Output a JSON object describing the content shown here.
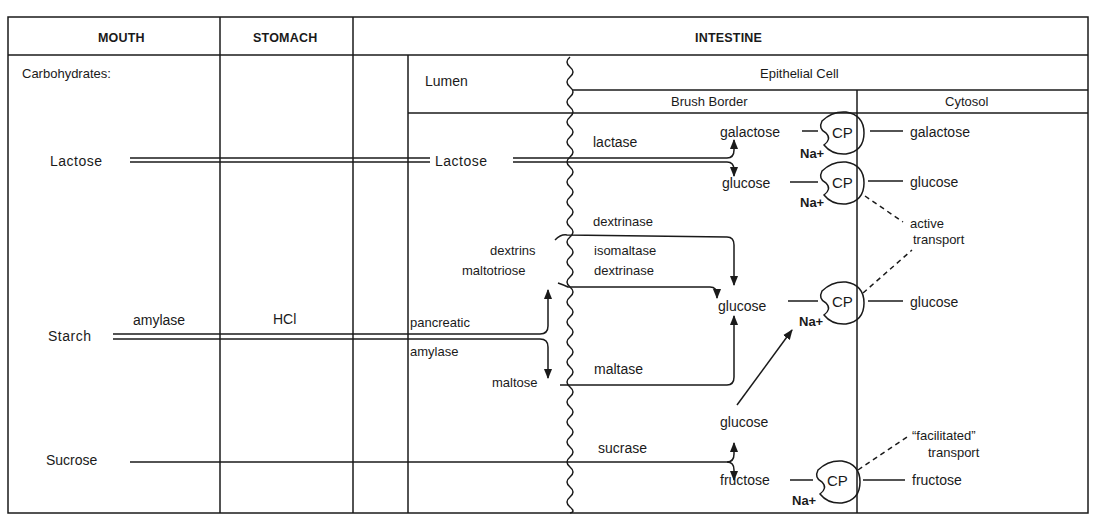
{
  "header": {
    "mouth": "MOUTH",
    "stomach": "STOMACH",
    "intestine": "INTESTINE"
  },
  "subheader": {
    "carbohydrates": "Carbohydrates:",
    "lumen": "Lumen",
    "epithelial_cell": "Epithelial Cell",
    "brush_border": "Brush Border",
    "cytosol": "Cytosol"
  },
  "mouth": {
    "lactose": "Lactose",
    "starch": "Starch",
    "amylase": "amylase",
    "sucrose": "Sucrose"
  },
  "stomach": {
    "hcl": "HCl"
  },
  "lumen": {
    "lactose": "Lactose",
    "pancreatic": "pancreatic",
    "amylase": "amylase",
    "dextrins": "dextrins",
    "maltotriose": "maltotriose",
    "maltose": "maltose"
  },
  "brush_border": {
    "lactase": "lactase",
    "galactose": "galactose",
    "glucose_1": "glucose",
    "dextrinase_1": "dextrinase",
    "isomaltase": "isomaltase",
    "dextrinase_2": "dextrinase",
    "glucose_2": "glucose",
    "maltase": "maltase",
    "glucose_3": "glucose",
    "sucrase": "sucrase",
    "fructose": "fructose"
  },
  "carriers": {
    "cp": "CP",
    "na": "Na+"
  },
  "cytosol": {
    "galactose": "galactose",
    "glucose_1": "glucose",
    "active_1": "active",
    "active_2": "transport",
    "glucose_2": "glucose",
    "facilitated_1": "“facilitated”",
    "facilitated_2": "transport",
    "fructose": "fructose"
  }
}
